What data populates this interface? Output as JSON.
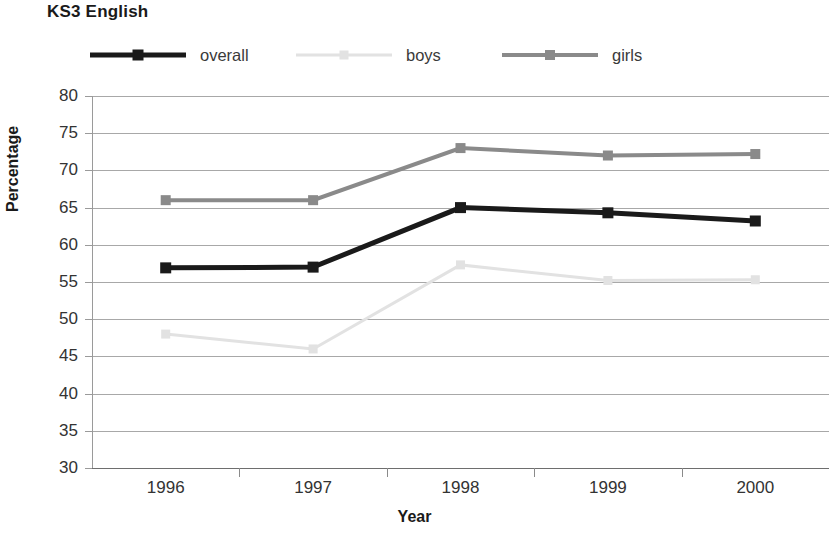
{
  "chart_data": {
    "type": "line",
    "title": "KS3 English",
    "xlabel": "Year",
    "ylabel": "Percentage",
    "categories": [
      "1996",
      "1997",
      "1998",
      "1999",
      "2000"
    ],
    "ylim": [
      30,
      80
    ],
    "yticks": [
      30,
      35,
      40,
      45,
      50,
      55,
      60,
      65,
      70,
      75,
      80
    ],
    "grid": true,
    "legend_position": "top",
    "series": [
      {
        "name": "overall",
        "color": "#1a1a1a",
        "values": [
          56.9,
          57.0,
          65.0,
          64.3,
          63.2
        ]
      },
      {
        "name": "boys",
        "color": "#e2e2e2",
        "values": [
          48.0,
          46.0,
          57.3,
          55.2,
          55.3
        ]
      },
      {
        "name": "girls",
        "color": "#8a8a8a",
        "values": [
          66.0,
          66.0,
          73.0,
          72.0,
          72.2
        ]
      }
    ]
  },
  "legend": {
    "items": [
      {
        "label": "overall"
      },
      {
        "label": "boys"
      },
      {
        "label": "girls"
      }
    ]
  }
}
